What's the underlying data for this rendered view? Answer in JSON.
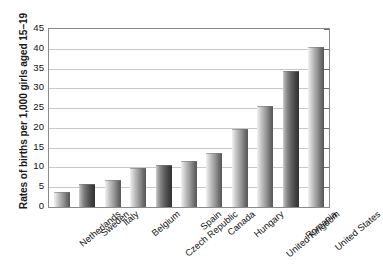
{
  "chart_data": {
    "type": "bar",
    "title": "",
    "subtitle": "",
    "xlabel": "",
    "ylabel": "Rates of births per 1,000 girls aged 15–19",
    "ylim": [
      0,
      45
    ],
    "ytick_step": 5,
    "yticks": [
      45,
      40,
      35,
      30,
      25,
      20,
      15,
      10,
      5,
      0
    ],
    "ytick_labels": [
      "45",
      "40",
      "35",
      "30",
      "25",
      "20",
      "15",
      "10",
      "5",
      "0"
    ],
    "grid": true,
    "grid_axis": "y",
    "legend": null,
    "categories": [
      "Netherlands",
      "Sweden",
      "Italy",
      "Belgium",
      "Czech Republic",
      "Spain",
      "Canada",
      "Hungary",
      "United Kingdom",
      "Romania",
      "United States"
    ],
    "values": [
      3.8,
      5.8,
      6.7,
      9.8,
      10.6,
      11.6,
      13.6,
      19.6,
      25.5,
      34.4,
      40.4
    ],
    "bar_styles": [
      "light",
      "dark",
      "light",
      "light",
      "dark",
      "light",
      "light",
      "light",
      "light",
      "dark",
      "light"
    ],
    "annotations": []
  },
  "colors": {
    "background": "#ffffff",
    "frame": "#8a8a8a",
    "gridline": "#c8c8c8",
    "text": "#111111",
    "bar_light_start": "#f3f3f3",
    "bar_light_end": "#575757",
    "bar_dark_start": "#cfcfcf",
    "bar_dark_end": "#333333"
  }
}
